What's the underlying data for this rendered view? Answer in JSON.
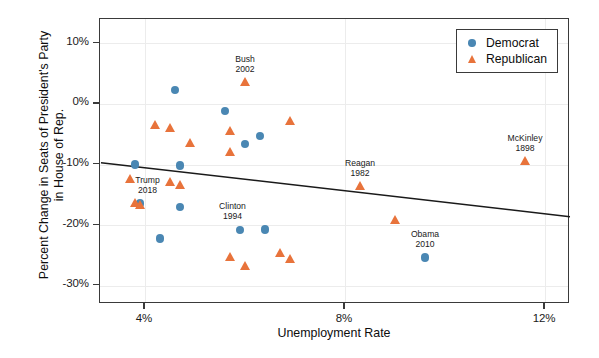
{
  "chart_data": {
    "type": "scatter",
    "title": "",
    "xlabel": "Unemployment Rate",
    "ylabel": "Percent Change in Seats of President's Party in House of Rep.",
    "xlim": [
      3.1,
      12.5
    ],
    "ylim": [
      -33.0,
      14.0
    ],
    "xticks": [
      "4%",
      "8%",
      "12%"
    ],
    "xtick_values": [
      4,
      8,
      12
    ],
    "yticks": [
      "10%",
      "0%",
      "-10%",
      "-20%",
      "-30%"
    ],
    "ytick_values": [
      10,
      0,
      -10,
      -20,
      -30
    ],
    "grid": true,
    "legend_position": "top-right",
    "colors": {
      "democrat": "#4a87b3",
      "republican": "#e8733b",
      "trendline": "#1a1a1a",
      "grid": "#ececec",
      "axis": "#3a3a3a"
    },
    "legend": [
      {
        "name": "Democrat",
        "marker": "circle",
        "color": "#4a87b3"
      },
      {
        "name": "Republican",
        "marker": "triangle",
        "color": "#e8733b"
      }
    ],
    "series": [
      {
        "name": "Democrat",
        "marker": "circle",
        "color": "#4a87b3",
        "points": [
          {
            "x": 4.6,
            "y": 2.3,
            "label": ""
          },
          {
            "x": 5.6,
            "y": -1.2,
            "label": ""
          },
          {
            "x": 6.3,
            "y": -5.3,
            "label": ""
          },
          {
            "x": 6.0,
            "y": -6.6,
            "label": ""
          },
          {
            "x": 4.7,
            "y": -10.2,
            "label": ""
          },
          {
            "x": 3.8,
            "y": -10.0,
            "label": ""
          },
          {
            "x": 3.9,
            "y": -16.4,
            "label": ""
          },
          {
            "x": 4.7,
            "y": -17.0,
            "label": ""
          },
          {
            "x": 5.9,
            "y": -20.8,
            "label": "Clinton 1994"
          },
          {
            "x": 6.4,
            "y": -20.7,
            "label": ""
          },
          {
            "x": 4.3,
            "y": -22.2,
            "label": ""
          },
          {
            "x": 9.6,
            "y": -25.3,
            "label": "Obama 2010"
          }
        ]
      },
      {
        "name": "Republican",
        "marker": "triangle",
        "color": "#e8733b",
        "points": [
          {
            "x": 6.0,
            "y": 3.6,
            "label": "Bush 2002"
          },
          {
            "x": 4.2,
            "y": -3.5,
            "label": ""
          },
          {
            "x": 4.5,
            "y": -4.0,
            "label": ""
          },
          {
            "x": 5.7,
            "y": -4.5,
            "label": ""
          },
          {
            "x": 6.9,
            "y": -2.8,
            "label": ""
          },
          {
            "x": 4.9,
            "y": -6.4,
            "label": ""
          },
          {
            "x": 5.7,
            "y": -8.0,
            "label": ""
          },
          {
            "x": 3.7,
            "y": -12.3,
            "label": ""
          },
          {
            "x": 4.5,
            "y": -12.8,
            "label": ""
          },
          {
            "x": 11.6,
            "y": -9.4,
            "label": "McKinley 1898"
          },
          {
            "x": 4.7,
            "y": -13.3,
            "label": ""
          },
          {
            "x": 3.8,
            "y": -16.3,
            "label": "Trump 2018"
          },
          {
            "x": 3.9,
            "y": -16.7,
            "label": ""
          },
          {
            "x": 8.3,
            "y": -13.5,
            "label": "Reagan 1982"
          },
          {
            "x": 5.7,
            "y": -25.3,
            "label": ""
          },
          {
            "x": 6.0,
            "y": -26.7,
            "label": ""
          },
          {
            "x": 6.7,
            "y": -24.5,
            "label": ""
          },
          {
            "x": 6.9,
            "y": -25.5,
            "label": ""
          },
          {
            "x": 9.0,
            "y": -19.2,
            "label": ""
          }
        ]
      }
    ],
    "annotations": [
      {
        "text_line1": "Bush",
        "text_line2": "2002",
        "x": 6.0,
        "y": 6.6
      },
      {
        "text_line1": "McKinley",
        "text_line2": "1898",
        "x": 11.6,
        "y": -6.4
      },
      {
        "text_line1": "Reagan",
        "text_line2": "1982",
        "x": 8.3,
        "y": -10.5
      },
      {
        "text_line1": "Trump",
        "text_line2": "2018",
        "x": 4.05,
        "y": -13.4
      },
      {
        "text_line1": "Clinton",
        "text_line2": "1994",
        "x": 5.75,
        "y": -17.7
      },
      {
        "text_line1": "Obama",
        "text_line2": "2010",
        "x": 9.6,
        "y": -22.3
      }
    ],
    "trendline": {
      "x1": 3.12,
      "y1": -9.7,
      "x2": 12.5,
      "y2": -18.6,
      "color": "#1a1a1a",
      "width": 1.5
    }
  }
}
